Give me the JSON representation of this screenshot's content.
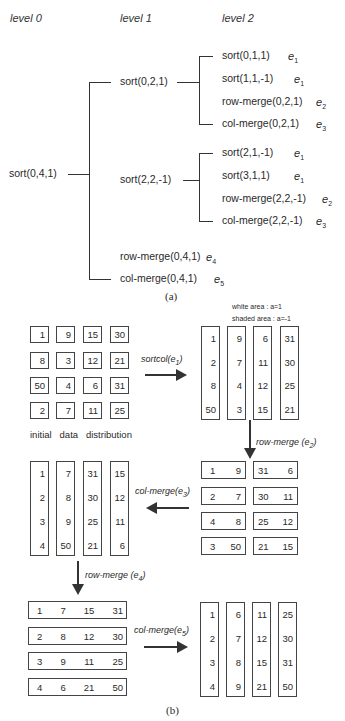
{
  "tree": {
    "levels": [
      "level 0",
      "level 1",
      "level 2"
    ],
    "root": "sort(0,4,1)",
    "level1": [
      {
        "label": "sort(0,2,1)"
      },
      {
        "label": "sort(2,2,-1)"
      },
      {
        "label": "row-merge(0,4,1)",
        "edge": "e",
        "edge_sub": "4"
      },
      {
        "label": "col-merge(0,4,1)",
        "edge": "e",
        "edge_sub": "5"
      }
    ],
    "level2_a": [
      {
        "label": "sort(0,1,1)",
        "edge": "e",
        "edge_sub": "1"
      },
      {
        "label": "sort(1,1,-1)",
        "edge": "e",
        "edge_sub": "1"
      },
      {
        "label": "row-merge(0,2,1)",
        "edge": "e",
        "edge_sub": "2"
      },
      {
        "label": "col-merge(0,2,1)",
        "edge": "e",
        "edge_sub": "3"
      }
    ],
    "level2_b": [
      {
        "label": "sort(2,1,-1)",
        "edge": "e",
        "edge_sub": "1"
      },
      {
        "label": "sort(3,1,1)",
        "edge": "e",
        "edge_sub": "1"
      },
      {
        "label": "row-merge(2,2,-1)",
        "edge": "e",
        "edge_sub": "2"
      },
      {
        "label": "col-merge(2,2,-1)",
        "edge": "e",
        "edge_sub": "3"
      }
    ],
    "caption": "(a)"
  },
  "steps": {
    "initial": {
      "label": "initial   data   distribution",
      "grid": [
        [
          "1",
          "9",
          "15",
          "30"
        ],
        [
          "8",
          "3",
          "12",
          "21"
        ],
        [
          "50",
          "4",
          "6",
          "31"
        ],
        [
          "2",
          "7",
          "11",
          "25"
        ]
      ]
    },
    "sortcol": {
      "arrow_label": "sortcol(e",
      "arrow_sub": "1",
      "arrow_close": ")",
      "note_white": "white area : a=1",
      "note_shaded": "shaded area : a=-1",
      "columns": [
        [
          "1",
          "2",
          "8",
          "50"
        ],
        [
          "9",
          "7",
          "4",
          "3"
        ],
        [
          "6",
          "11",
          "12",
          "15"
        ],
        [
          "31",
          "30",
          "25",
          "21"
        ]
      ]
    },
    "rowmerge2": {
      "arrow_label": "row-merge  (e",
      "arrow_sub": "2",
      "arrow_close": ")",
      "rows": [
        [
          [
            "1",
            "9"
          ],
          [
            "31",
            "6"
          ]
        ],
        [
          [
            "2",
            "7"
          ],
          [
            "30",
            "11"
          ]
        ],
        [
          [
            "4",
            "8"
          ],
          [
            "25",
            "12"
          ]
        ],
        [
          [
            "3",
            "50"
          ],
          [
            "21",
            "15"
          ]
        ]
      ]
    },
    "colmerge3": {
      "arrow_label": "col-merge(e",
      "arrow_sub": "3",
      "arrow_close": ")",
      "columns": [
        [
          "1",
          "2",
          "3",
          "4"
        ],
        [
          "7",
          "8",
          "9",
          "50"
        ],
        [
          "31",
          "30",
          "25",
          "21"
        ],
        [
          "15",
          "12",
          "11",
          "6"
        ]
      ]
    },
    "rowmerge4": {
      "arrow_label": "row-merge  (e",
      "arrow_sub": "4",
      "arrow_close": ")",
      "rows": [
        [
          "1",
          "7",
          "15",
          "31"
        ],
        [
          "2",
          "8",
          "12",
          "30"
        ],
        [
          "3",
          "9",
          "11",
          "25"
        ],
        [
          "4",
          "6",
          "21",
          "50"
        ]
      ]
    },
    "colmerge5": {
      "arrow_label": "col-merge(e",
      "arrow_sub": "5",
      "arrow_close": ")",
      "columns": [
        [
          "1",
          "2",
          "3",
          "4"
        ],
        [
          "6",
          "7",
          "8",
          "9"
        ],
        [
          "11",
          "12",
          "15",
          "21"
        ],
        [
          "25",
          "30",
          "31",
          "50"
        ]
      ]
    },
    "caption": "(b)"
  }
}
